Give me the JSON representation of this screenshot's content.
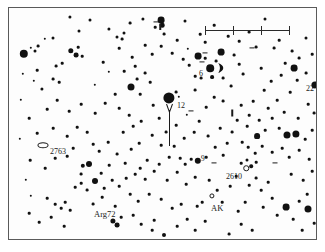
{
  "chart_type": "star-finder-chart",
  "frame": {
    "border_color": "#5a5a5a",
    "background_color": "#fdfdfd",
    "star_color": "#111111"
  },
  "scale_bar": {
    "name": "scale-bar",
    "x": 196,
    "y": 18,
    "width": 84,
    "ticks": [
      0,
      28,
      56,
      84
    ]
  },
  "target_arrow": {
    "name": "target-arrow",
    "x": 160,
    "y": 96,
    "length": 42,
    "points_to": "12"
  },
  "labels": [
    {
      "id": "label-12",
      "text": "12",
      "x": 168,
      "y": 94,
      "size": 8
    },
    {
      "id": "label-6",
      "text": "6",
      "x": 190,
      "y": 62,
      "size": 8
    },
    {
      "id": "label-22",
      "text": "22",
      "x": 297,
      "y": 77,
      "size": 8
    },
    {
      "id": "label-9",
      "text": "9",
      "x": 192,
      "y": 147,
      "size": 7.5
    },
    {
      "id": "label-2610",
      "text": "2610",
      "x": 217,
      "y": 165,
      "size": 8
    },
    {
      "id": "label-2763",
      "text": "2763",
      "x": 41,
      "y": 140,
      "size": 8
    },
    {
      "id": "label-arg72",
      "text": "Arg72",
      "x": 85,
      "y": 202,
      "size": 8.5
    },
    {
      "id": "label-ak",
      "text": "AK",
      "x": 202,
      "y": 196,
      "size": 8.5
    }
  ],
  "markers": [
    {
      "id": "marker-2763-ellipse",
      "kind": "ellipse",
      "x": 34,
      "y": 137,
      "w": 9,
      "h": 3.5
    },
    {
      "id": "marker-2610-dot",
      "kind": "circle",
      "x": 237,
      "y": 160,
      "w": 3.5,
      "h": 3.5
    },
    {
      "id": "marker-ak-circle",
      "kind": "circle",
      "x": 203,
      "y": 188,
      "w": 3.2,
      "h": 3.2
    },
    {
      "id": "marker-crescent",
      "kind": "crescent",
      "x": 212,
      "y": 60,
      "w": 8,
      "h": 10
    }
  ],
  "tickmarks": [
    {
      "id": "tick-a",
      "x": 147,
      "y": 14,
      "w": 5,
      "h": 1.2,
      "rot": 0
    },
    {
      "id": "tick-b",
      "x": 196,
      "y": 45,
      "w": 5,
      "h": 1.2,
      "rot": 0
    },
    {
      "id": "tick-c",
      "x": 193,
      "y": 54,
      "w": 5,
      "h": 1.2,
      "rot": 0
    },
    {
      "id": "tick-d",
      "x": 182,
      "y": 103,
      "w": 5,
      "h": 1.2,
      "rot": 0
    },
    {
      "id": "tick-e",
      "x": 223,
      "y": 105,
      "w": 1.5,
      "h": 7,
      "rot": 0
    },
    {
      "id": "tick-f",
      "x": 205,
      "y": 155,
      "w": 5,
      "h": 1.2,
      "rot": 0
    },
    {
      "id": "tick-g",
      "x": 248,
      "y": 130,
      "w": 5,
      "h": 1.2,
      "rot": 0
    },
    {
      "id": "tick-h",
      "x": 266,
      "y": 155,
      "w": 5,
      "h": 1.2,
      "rot": 0
    },
    {
      "id": "tick-i",
      "x": 243,
      "y": 40,
      "w": 5,
      "h": 1.2,
      "rot": 0
    },
    {
      "id": "tick-j",
      "x": 151,
      "y": 19,
      "w": 1.5,
      "h": 6,
      "rot": 0
    }
  ],
  "stars": [
    {
      "x": 15,
      "y": 46,
      "r": 4.2
    },
    {
      "x": 22,
      "y": 40,
      "r": 1.2
    },
    {
      "x": 26,
      "y": 43,
      "r": 1.5
    },
    {
      "x": 29,
      "y": 38,
      "r": 1.4
    },
    {
      "x": 44,
      "y": 30,
      "r": 1.5
    },
    {
      "x": 61,
      "y": 9,
      "r": 1.6
    },
    {
      "x": 70,
      "y": 23,
      "r": 1.5
    },
    {
      "x": 81,
      "y": 12,
      "r": 1.5
    },
    {
      "x": 47,
      "y": 58,
      "r": 1.4
    },
    {
      "x": 36,
      "y": 31,
      "r": 1.2
    },
    {
      "x": 62,
      "y": 43,
      "r": 2.7
    },
    {
      "x": 67,
      "y": 47,
      "r": 2.4
    },
    {
      "x": 69,
      "y": 39,
      "r": 1.3
    },
    {
      "x": 73,
      "y": 48,
      "r": 1.3
    },
    {
      "x": 53,
      "y": 55,
      "r": 1.3
    },
    {
      "x": 33,
      "y": 81,
      "r": 1.6
    },
    {
      "x": 44,
      "y": 71,
      "r": 1.4
    },
    {
      "x": 50,
      "y": 74,
      "r": 1.3
    },
    {
      "x": 25,
      "y": 73,
      "r": 1.2
    },
    {
      "x": 100,
      "y": 21,
      "r": 1.6
    },
    {
      "x": 108,
      "y": 29,
      "r": 1.5
    },
    {
      "x": 115,
      "y": 25,
      "r": 1.5
    },
    {
      "x": 113,
      "y": 31,
      "r": 1.4
    },
    {
      "x": 121,
      "y": 15,
      "r": 1.4
    },
    {
      "x": 134,
      "y": 11,
      "r": 1.6
    },
    {
      "x": 146,
      "y": 19,
      "r": 1.3
    },
    {
      "x": 152,
      "y": 12,
      "r": 3.4
    },
    {
      "x": 153,
      "y": 17,
      "r": 2.3
    },
    {
      "x": 155,
      "y": 26,
      "r": 1.4
    },
    {
      "x": 176,
      "y": 13,
      "r": 1.5
    },
    {
      "x": 110,
      "y": 40,
      "r": 1.3
    },
    {
      "x": 123,
      "y": 49,
      "r": 1.3
    },
    {
      "x": 94,
      "y": 54,
      "r": 1.3
    },
    {
      "x": 100,
      "y": 64,
      "r": 1.2
    },
    {
      "x": 86,
      "y": 77,
      "r": 1.2
    },
    {
      "x": 122,
      "y": 79,
      "r": 3.5
    },
    {
      "x": 131,
      "y": 86,
      "r": 1.3
    },
    {
      "x": 128,
      "y": 71,
      "r": 1.4
    },
    {
      "x": 136,
      "y": 65,
      "r": 1.4
    },
    {
      "x": 141,
      "y": 74,
      "r": 1.3
    },
    {
      "x": 160,
      "y": 90,
      "r": 5.6
    },
    {
      "x": 167,
      "y": 84,
      "r": 1.4
    },
    {
      "x": 170,
      "y": 89,
      "r": 1.2
    },
    {
      "x": 144,
      "y": 97,
      "r": 1.3
    },
    {
      "x": 186,
      "y": 82,
      "r": 1.4
    },
    {
      "x": 192,
      "y": 70,
      "r": 1.4
    },
    {
      "x": 189,
      "y": 48,
      "r": 3.4
    },
    {
      "x": 196,
      "y": 50,
      "r": 1.3
    },
    {
      "x": 201,
      "y": 60,
      "r": 3.8
    },
    {
      "x": 212,
      "y": 44,
      "r": 3.4
    },
    {
      "x": 207,
      "y": 53,
      "r": 1.4
    },
    {
      "x": 203,
      "y": 69,
      "r": 1.9
    },
    {
      "x": 214,
      "y": 70,
      "r": 1.4
    },
    {
      "x": 180,
      "y": 57,
      "r": 1.3
    },
    {
      "x": 186,
      "y": 68,
      "r": 1.3
    },
    {
      "x": 179,
      "y": 41,
      "r": 1.2
    },
    {
      "x": 196,
      "y": 34,
      "r": 1.3
    },
    {
      "x": 225,
      "y": 47,
      "r": 1.4
    },
    {
      "x": 230,
      "y": 56,
      "r": 1.3
    },
    {
      "x": 234,
      "y": 66,
      "r": 1.4
    },
    {
      "x": 222,
      "y": 78,
      "r": 1.4
    },
    {
      "x": 247,
      "y": 39,
      "r": 1.4
    },
    {
      "x": 256,
      "y": 11,
      "r": 1.5
    },
    {
      "x": 265,
      "y": 40,
      "r": 1.4
    },
    {
      "x": 270,
      "y": 32,
      "r": 1.3
    },
    {
      "x": 283,
      "y": 43,
      "r": 1.4
    },
    {
      "x": 276,
      "y": 55,
      "r": 1.3
    },
    {
      "x": 285,
      "y": 60,
      "r": 3.4
    },
    {
      "x": 290,
      "y": 50,
      "r": 1.4
    },
    {
      "x": 297,
      "y": 30,
      "r": 1.5
    },
    {
      "x": 303,
      "y": 46,
      "r": 1.3
    },
    {
      "x": 306,
      "y": 77,
      "r": 3.6
    },
    {
      "x": 297,
      "y": 65,
      "r": 1.4
    },
    {
      "x": 288,
      "y": 72,
      "r": 1.3
    },
    {
      "x": 281,
      "y": 84,
      "r": 1.3
    },
    {
      "x": 299,
      "y": 96,
      "r": 1.3
    },
    {
      "x": 305,
      "y": 105,
      "r": 1.4
    },
    {
      "x": 289,
      "y": 110,
      "r": 1.3
    },
    {
      "x": 255,
      "y": 82,
      "r": 1.3
    },
    {
      "x": 244,
      "y": 93,
      "r": 1.3
    },
    {
      "x": 259,
      "y": 100,
      "r": 1.3
    },
    {
      "x": 268,
      "y": 92,
      "r": 1.3
    },
    {
      "x": 232,
      "y": 97,
      "r": 1.3
    },
    {
      "x": 214,
      "y": 93,
      "r": 1.4
    },
    {
      "x": 205,
      "y": 89,
      "r": 1.3
    },
    {
      "x": 197,
      "y": 99,
      "r": 1.3
    },
    {
      "x": 178,
      "y": 107,
      "r": 1.2
    },
    {
      "x": 190,
      "y": 113,
      "r": 1.3
    },
    {
      "x": 167,
      "y": 117,
      "r": 1.3
    },
    {
      "x": 150,
      "y": 110,
      "r": 1.3
    },
    {
      "x": 157,
      "y": 124,
      "r": 1.4
    },
    {
      "x": 143,
      "y": 127,
      "r": 1.3
    },
    {
      "x": 175,
      "y": 130,
      "r": 1.3
    },
    {
      "x": 185,
      "y": 124,
      "r": 1.3
    },
    {
      "x": 199,
      "y": 128,
      "r": 1.4
    },
    {
      "x": 211,
      "y": 120,
      "r": 1.3
    },
    {
      "x": 223,
      "y": 124,
      "r": 1.4
    },
    {
      "x": 238,
      "y": 118,
      "r": 1.3
    },
    {
      "x": 248,
      "y": 128,
      "r": 2.9
    },
    {
      "x": 256,
      "y": 122,
      "r": 1.3
    },
    {
      "x": 270,
      "y": 120,
      "r": 1.3
    },
    {
      "x": 278,
      "y": 127,
      "r": 3.5
    },
    {
      "x": 287,
      "y": 126,
      "r": 3.6
    },
    {
      "x": 296,
      "y": 131,
      "r": 1.3
    },
    {
      "x": 303,
      "y": 122,
      "r": 1.3
    },
    {
      "x": 311,
      "y": 133,
      "r": 1.3
    },
    {
      "x": 239,
      "y": 139,
      "r": 1.3
    },
    {
      "x": 246,
      "y": 145,
      "r": 1.3
    },
    {
      "x": 253,
      "y": 138,
      "r": 1.3
    },
    {
      "x": 263,
      "y": 144,
      "r": 1.3
    },
    {
      "x": 273,
      "y": 140,
      "r": 1.3
    },
    {
      "x": 280,
      "y": 149,
      "r": 1.3
    },
    {
      "x": 290,
      "y": 142,
      "r": 1.3
    },
    {
      "x": 300,
      "y": 151,
      "r": 1.3
    },
    {
      "x": 232,
      "y": 155,
      "r": 1.3
    },
    {
      "x": 238,
      "y": 152,
      "r": 1.5
    },
    {
      "x": 242,
      "y": 158,
      "r": 1.8
    },
    {
      "x": 247,
      "y": 154,
      "r": 1.3
    },
    {
      "x": 189,
      "y": 153,
      "r": 3.2
    },
    {
      "x": 182,
      "y": 151,
      "r": 1.3
    },
    {
      "x": 197,
      "y": 149,
      "r": 1.3
    },
    {
      "x": 176,
      "y": 156,
      "r": 1.3
    },
    {
      "x": 171,
      "y": 150,
      "r": 1.3
    },
    {
      "x": 160,
      "y": 149,
      "r": 1.3
    },
    {
      "x": 150,
      "y": 156,
      "r": 1.3
    },
    {
      "x": 138,
      "y": 152,
      "r": 1.3
    },
    {
      "x": 131,
      "y": 160,
      "r": 1.3
    },
    {
      "x": 206,
      "y": 139,
      "r": 1.3
    },
    {
      "x": 214,
      "y": 147,
      "r": 1.3
    },
    {
      "x": 218,
      "y": 135,
      "r": 1.3
    },
    {
      "x": 165,
      "y": 138,
      "r": 1.3
    },
    {
      "x": 152,
      "y": 137,
      "r": 1.3
    },
    {
      "x": 28,
      "y": 125,
      "r": 1.3
    },
    {
      "x": 21,
      "y": 152,
      "r": 1.3
    },
    {
      "x": 17,
      "y": 172,
      "r": 1.2
    },
    {
      "x": 22,
      "y": 188,
      "r": 1.2
    },
    {
      "x": 20,
      "y": 205,
      "r": 1.3
    },
    {
      "x": 38,
      "y": 190,
      "r": 1.3
    },
    {
      "x": 46,
      "y": 196,
      "r": 1.3
    },
    {
      "x": 52,
      "y": 200,
      "r": 1.3
    },
    {
      "x": 56,
      "y": 194,
      "r": 1.3
    },
    {
      "x": 61,
      "y": 202,
      "r": 1.3
    },
    {
      "x": 42,
      "y": 209,
      "r": 1.3
    },
    {
      "x": 30,
      "y": 214,
      "r": 1.3
    },
    {
      "x": 55,
      "y": 218,
      "r": 1.3
    },
    {
      "x": 72,
      "y": 166,
      "r": 1.4
    },
    {
      "x": 74,
      "y": 158,
      "r": 2.2
    },
    {
      "x": 80,
      "y": 156,
      "r": 3.0
    },
    {
      "x": 66,
      "y": 179,
      "r": 1.3
    },
    {
      "x": 72,
      "y": 175,
      "r": 1.3
    },
    {
      "x": 78,
      "y": 182,
      "r": 1.4
    },
    {
      "x": 86,
      "y": 173,
      "r": 3.0
    },
    {
      "x": 95,
      "y": 180,
      "r": 1.3
    },
    {
      "x": 103,
      "y": 172,
      "r": 1.3
    },
    {
      "x": 110,
      "y": 178,
      "r": 1.3
    },
    {
      "x": 117,
      "y": 170,
      "r": 1.3
    },
    {
      "x": 92,
      "y": 165,
      "r": 1.3
    },
    {
      "x": 100,
      "y": 157,
      "r": 1.3
    },
    {
      "x": 108,
      "y": 146,
      "r": 1.4
    },
    {
      "x": 116,
      "y": 155,
      "r": 1.3
    },
    {
      "x": 122,
      "y": 141,
      "r": 1.3
    },
    {
      "x": 130,
      "y": 135,
      "r": 1.3
    },
    {
      "x": 99,
      "y": 134,
      "r": 1.3
    },
    {
      "x": 90,
      "y": 143,
      "r": 1.3
    },
    {
      "x": 84,
      "y": 136,
      "r": 1.3
    },
    {
      "x": 93,
      "y": 189,
      "r": 1.3
    },
    {
      "x": 84,
      "y": 196,
      "r": 1.4
    },
    {
      "x": 106,
      "y": 198,
      "r": 1.3
    },
    {
      "x": 112,
      "y": 209,
      "r": 1.3
    },
    {
      "x": 104,
      "y": 213,
      "r": 2.6
    },
    {
      "x": 108,
      "y": 217,
      "r": 2.4
    },
    {
      "x": 124,
      "y": 207,
      "r": 1.3
    },
    {
      "x": 132,
      "y": 216,
      "r": 1.3
    },
    {
      "x": 145,
      "y": 212,
      "r": 1.3
    },
    {
      "x": 155,
      "y": 227,
      "r": 2.0
    },
    {
      "x": 143,
      "y": 222,
      "r": 1.3
    },
    {
      "x": 168,
      "y": 218,
      "r": 1.3
    },
    {
      "x": 178,
      "y": 211,
      "r": 1.3
    },
    {
      "x": 186,
      "y": 222,
      "r": 1.3
    },
    {
      "x": 196,
      "y": 213,
      "r": 1.3
    },
    {
      "x": 188,
      "y": 198,
      "r": 1.3
    },
    {
      "x": 193,
      "y": 194,
      "r": 1.3
    },
    {
      "x": 213,
      "y": 194,
      "r": 1.3
    },
    {
      "x": 208,
      "y": 182,
      "r": 1.3
    },
    {
      "x": 220,
      "y": 226,
      "r": 1.4
    },
    {
      "x": 232,
      "y": 216,
      "r": 1.3
    },
    {
      "x": 243,
      "y": 222,
      "r": 1.3
    },
    {
      "x": 229,
      "y": 203,
      "r": 1.3
    },
    {
      "x": 236,
      "y": 194,
      "r": 1.3
    },
    {
      "x": 240,
      "y": 177,
      "r": 1.3
    },
    {
      "x": 247,
      "y": 170,
      "r": 1.4
    },
    {
      "x": 252,
      "y": 182,
      "r": 1.3
    },
    {
      "x": 259,
      "y": 174,
      "r": 1.3
    },
    {
      "x": 263,
      "y": 190,
      "r": 1.3
    },
    {
      "x": 254,
      "y": 199,
      "r": 1.3
    },
    {
      "x": 268,
      "y": 207,
      "r": 1.3
    },
    {
      "x": 277,
      "y": 199,
      "r": 3.4
    },
    {
      "x": 284,
      "y": 211,
      "r": 1.3
    },
    {
      "x": 290,
      "y": 193,
      "r": 1.3
    },
    {
      "x": 299,
      "y": 201,
      "r": 3.5
    },
    {
      "x": 293,
      "y": 222,
      "r": 1.3
    },
    {
      "x": 305,
      "y": 215,
      "r": 1.3
    },
    {
      "x": 282,
      "y": 166,
      "r": 1.3
    },
    {
      "x": 294,
      "y": 172,
      "r": 1.3
    },
    {
      "x": 303,
      "y": 163,
      "r": 1.3
    },
    {
      "x": 309,
      "y": 185,
      "r": 1.3
    },
    {
      "x": 298,
      "y": 186,
      "r": 1.3
    },
    {
      "x": 311,
      "y": 206,
      "r": 1.3
    },
    {
      "x": 163,
      "y": 200,
      "r": 1.3
    },
    {
      "x": 172,
      "y": 196,
      "r": 1.3
    },
    {
      "x": 152,
      "y": 191,
      "r": 1.3
    },
    {
      "x": 140,
      "y": 186,
      "r": 1.3
    },
    {
      "x": 129,
      "y": 193,
      "r": 1.3
    },
    {
      "x": 121,
      "y": 186,
      "r": 1.3
    },
    {
      "x": 136,
      "y": 171,
      "r": 1.3
    },
    {
      "x": 126,
      "y": 166,
      "r": 1.3
    },
    {
      "x": 145,
      "y": 163,
      "r": 1.3
    },
    {
      "x": 158,
      "y": 172,
      "r": 1.3
    },
    {
      "x": 168,
      "y": 164,
      "r": 1.3
    },
    {
      "x": 177,
      "y": 176,
      "r": 1.3
    },
    {
      "x": 186,
      "y": 169,
      "r": 1.3
    },
    {
      "x": 200,
      "y": 172,
      "r": 1.3
    },
    {
      "x": 221,
      "y": 178,
      "r": 1.3
    },
    {
      "x": 227,
      "y": 168,
      "r": 1.3
    },
    {
      "x": 233,
      "y": 134,
      "r": 1.3
    },
    {
      "x": 228,
      "y": 112,
      "r": 1.3
    },
    {
      "x": 240,
      "y": 107,
      "r": 1.3
    },
    {
      "x": 250,
      "y": 112,
      "r": 1.3
    },
    {
      "x": 263,
      "y": 110,
      "r": 1.3
    },
    {
      "x": 275,
      "y": 104,
      "r": 1.3
    },
    {
      "x": 272,
      "y": 67,
      "r": 1.3
    },
    {
      "x": 262,
      "y": 73,
      "r": 1.3
    },
    {
      "x": 252,
      "y": 60,
      "r": 1.3
    },
    {
      "x": 240,
      "y": 24,
      "r": 1.4
    },
    {
      "x": 230,
      "y": 33,
      "r": 1.3
    },
    {
      "x": 219,
      "y": 28,
      "r": 1.3
    },
    {
      "x": 205,
      "y": 17,
      "r": 1.3
    },
    {
      "x": 191,
      "y": 26,
      "r": 1.3
    },
    {
      "x": 168,
      "y": 32,
      "r": 1.3
    },
    {
      "x": 163,
      "y": 45,
      "r": 1.3
    },
    {
      "x": 174,
      "y": 51,
      "r": 1.3
    },
    {
      "x": 152,
      "y": 38,
      "r": 1.3
    },
    {
      "x": 143,
      "y": 46,
      "r": 1.3
    },
    {
      "x": 136,
      "y": 37,
      "r": 1.3
    },
    {
      "x": 126,
      "y": 58,
      "r": 1.3
    },
    {
      "x": 115,
      "y": 63,
      "r": 1.3
    },
    {
      "x": 106,
      "y": 86,
      "r": 1.3
    },
    {
      "x": 96,
      "y": 95,
      "r": 1.3
    },
    {
      "x": 110,
      "y": 100,
      "r": 1.3
    },
    {
      "x": 120,
      "y": 107,
      "r": 1.3
    },
    {
      "x": 132,
      "y": 113,
      "r": 1.3
    },
    {
      "x": 86,
      "y": 105,
      "r": 1.3
    },
    {
      "x": 72,
      "y": 96,
      "r": 1.3
    },
    {
      "x": 60,
      "y": 103,
      "r": 1.3
    },
    {
      "x": 48,
      "y": 92,
      "r": 1.3
    },
    {
      "x": 38,
      "y": 101,
      "r": 1.3
    },
    {
      "x": 20,
      "y": 110,
      "r": 1.3
    },
    {
      "x": 28,
      "y": 62,
      "r": 1.3
    },
    {
      "x": 12,
      "y": 92,
      "r": 1.2
    },
    {
      "x": 11,
      "y": 131,
      "r": 1.2
    },
    {
      "x": 14,
      "y": 66,
      "r": 1.2
    },
    {
      "x": 58,
      "y": 128,
      "r": 1.3
    },
    {
      "x": 68,
      "y": 119,
      "r": 1.3
    },
    {
      "x": 78,
      "y": 124,
      "r": 1.3
    },
    {
      "x": 44,
      "y": 120,
      "r": 1.3
    },
    {
      "x": 36,
      "y": 160,
      "r": 1.3
    },
    {
      "x": 46,
      "y": 150,
      "r": 1.3
    },
    {
      "x": 58,
      "y": 148,
      "r": 1.3
    },
    {
      "x": 64,
      "y": 140,
      "r": 1.3
    },
    {
      "x": 114,
      "y": 124,
      "r": 1.3
    },
    {
      "x": 124,
      "y": 118,
      "r": 1.3
    }
  ]
}
